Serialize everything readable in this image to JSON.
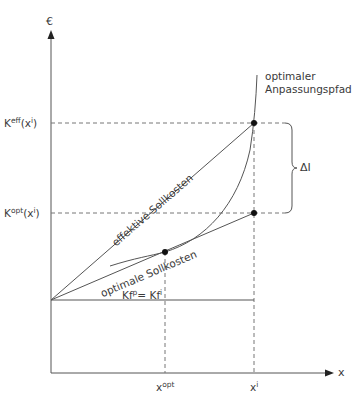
{
  "axes": {
    "y_label": "€",
    "x_label": "x"
  },
  "y_ticks": {
    "k_eff": {
      "base": "K",
      "sup": "eff",
      "arg": "(x",
      "arg_sup": "i",
      "close": ")"
    },
    "k_opt": {
      "base": "K",
      "sup": "opt",
      "arg": "(x",
      "arg_sup": "i",
      "close": ")"
    }
  },
  "x_ticks": {
    "x_opt": {
      "base": "x",
      "sup": "opt"
    },
    "x_i": {
      "base": "x",
      "sup": "i"
    }
  },
  "labels": {
    "path_line1": "optimaler",
    "path_line2": "Anpassungspfad",
    "effective": "effektive Sollkosten",
    "optimal": "optimale Sollkosten",
    "fixed_base": "Kf",
    "fixed_sup1": "p",
    "fixed_eq": "= Kf",
    "fixed_sup2": "i",
    "delta": "ΔI"
  },
  "colors": {
    "line": "#555555",
    "dash": "#777777",
    "point": "#111111"
  }
}
